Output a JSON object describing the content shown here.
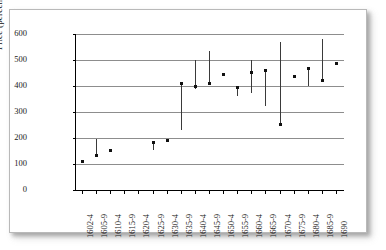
{
  "chart_data": {
    "type": "bar",
    "subtype": "high-low-range",
    "title": "",
    "xlabel": "",
    "ylabel": "Price (percent of par)",
    "ylim": [
      0,
      600
    ],
    "ytick_labels": [
      "0",
      "100",
      "200",
      "300",
      "400",
      "500",
      "600"
    ],
    "ytick_values": [
      0,
      100,
      200,
      300,
      400,
      500,
      600
    ],
    "grid": true,
    "legend": "none",
    "categories": [
      "1602-4",
      "1605-9",
      "1610-4",
      "1615-9",
      "1620-4",
      "1625-9",
      "1630-4",
      "1635-9",
      "1640-4",
      "1645-9",
      "1650-4",
      "1655-9",
      "1660-4",
      "1665-9",
      "1670-4",
      "1675-9",
      "1680-4",
      "1685-9",
      "1690"
    ],
    "series": [
      {
        "name": "high",
        "values": [
          112,
          196,
          153,
          null,
          null,
          185,
          196,
          412,
          500,
          535,
          450,
          400,
          500,
          465,
          570,
          441,
          470,
          580,
          492
        ]
      },
      {
        "name": "low",
        "values": [
          107,
          133,
          151,
          null,
          null,
          155,
          192,
          230,
          388,
          412,
          445,
          360,
          375,
          323,
          250,
          437,
          400,
          420,
          489
        ]
      },
      {
        "name": "close",
        "values": [
          110,
          135,
          152,
          null,
          null,
          183,
          194,
          412,
          400,
          412,
          448,
          398,
          452,
          462,
          252,
          440,
          468,
          422,
          490
        ]
      }
    ]
  },
  "axis": {
    "y_title": "Price (percent of par)"
  },
  "colors": {
    "gridline": "#8d8d8d",
    "axis": "#000000",
    "bar": "#3a3a3a",
    "marker": "#111111",
    "background": "#ffffff",
    "frame_border": "#b9b9b9"
  }
}
